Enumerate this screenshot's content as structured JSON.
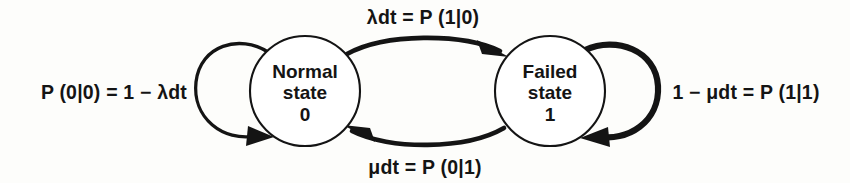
{
  "diagram": {
    "background_color": "#fdfdfb",
    "stroke_color": "#141414",
    "nodes": [
      {
        "id": "state-0",
        "name": "normal-state-node",
        "line1": "Normal",
        "line2": "state",
        "line3": "0",
        "cx": 305,
        "cy": 91,
        "r": 55
      },
      {
        "id": "state-1",
        "name": "failed-state-node",
        "line1": "Failed",
        "line2": "state",
        "line3": "1",
        "cx": 550,
        "cy": 91,
        "r": 55
      }
    ],
    "edges": [
      {
        "id": "edge-0-to-1",
        "name": "transition-normal-to-failed",
        "label": "λdt = P (1|0)",
        "label_x": 423,
        "label_y": 24,
        "from": "state-0",
        "to": "state-1"
      },
      {
        "id": "edge-1-to-0",
        "name": "transition-failed-to-normal",
        "label": "μdt = P (0|1)",
        "label_x": 425,
        "label_y": 174,
        "from": "state-1",
        "to": "state-0"
      },
      {
        "id": "edge-0-to-0",
        "name": "self-loop-normal",
        "label": "P (0|0) = 1 − λdt",
        "label_x": 114,
        "label_y": 99,
        "from": "state-0",
        "to": "state-0"
      },
      {
        "id": "edge-1-to-1",
        "name": "self-loop-failed",
        "label": "1 − μdt = P (1|1)",
        "label_x": 746,
        "label_y": 99,
        "from": "state-1",
        "to": "state-1"
      }
    ]
  }
}
